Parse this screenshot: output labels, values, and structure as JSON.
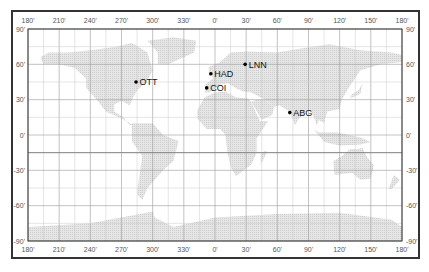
{
  "map": {
    "title": "",
    "projection": "equirectangular",
    "extent": {
      "lon_min": -180,
      "lon_max": 180,
      "lat_min": -90,
      "lat_max": 90
    },
    "grid_step_deg": 15,
    "major_grid_step_deg": 30,
    "longitude_labels": [
      "180'",
      "210'",
      "240'",
      "270'",
      "300'",
      "330'",
      "0'",
      "30'",
      "60'",
      "90'",
      "120'",
      "150'",
      "180'"
    ],
    "latitude_labels": [
      "90'",
      "60'",
      "30'",
      "0'",
      "-30'",
      "-60'",
      "-90'"
    ],
    "colors": {
      "land": "#dcdcdc",
      "grid": "#c8c8c8",
      "grid_major": "#9a9a9a",
      "frame": "#333333",
      "station": "#000000"
    }
  },
  "stations": [
    {
      "code": "OTT",
      "lon": -76,
      "lat": 45
    },
    {
      "code": "HAD",
      "lon": -4,
      "lat": 52
    },
    {
      "code": "COI",
      "lon": -8,
      "lat": 40
    },
    {
      "code": "LNN",
      "lon": 29,
      "lat": 60
    },
    {
      "code": "ABG",
      "lon": 72,
      "lat": 19
    }
  ]
}
